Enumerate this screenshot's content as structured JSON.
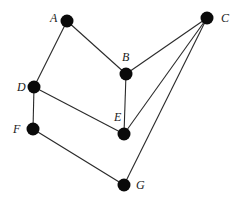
{
  "graph": {
    "nodes": [
      {
        "id": "A",
        "label": "A",
        "x": 67,
        "y": 21,
        "lx": 50,
        "ly": 22
      },
      {
        "id": "B",
        "label": "B",
        "x": 126,
        "y": 74,
        "lx": 122,
        "ly": 61
      },
      {
        "id": "C",
        "label": "C",
        "x": 207,
        "y": 18,
        "lx": 221,
        "ly": 22
      },
      {
        "id": "D",
        "label": "D",
        "x": 34,
        "y": 87,
        "lx": 17,
        "ly": 91
      },
      {
        "id": "E",
        "label": "E",
        "x": 124,
        "y": 134,
        "lx": 114,
        "ly": 121
      },
      {
        "id": "F",
        "label": "F",
        "x": 33,
        "y": 129,
        "lx": 13,
        "ly": 133
      },
      {
        "id": "G",
        "label": "G",
        "x": 124,
        "y": 185,
        "lx": 136,
        "ly": 189
      }
    ],
    "edges": [
      [
        "A",
        "B"
      ],
      [
        "A",
        "D"
      ],
      [
        "B",
        "C"
      ],
      [
        "B",
        "E"
      ],
      [
        "C",
        "E"
      ],
      [
        "C",
        "G"
      ],
      [
        "D",
        "E"
      ],
      [
        "D",
        "F"
      ],
      [
        "F",
        "G"
      ]
    ],
    "colors": {
      "node": "#0a0a0a",
      "edge": "#2a2a2a",
      "background": "#ffffff"
    }
  }
}
